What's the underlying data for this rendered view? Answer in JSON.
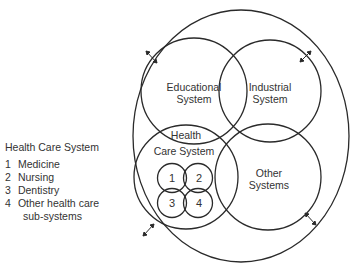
{
  "diagram": {
    "outer_circle": {
      "label": ""
    },
    "systems": [
      {
        "id": "educational",
        "line1": "Educational",
        "line2": "System"
      },
      {
        "id": "industrial",
        "line1": "Industrial",
        "line2": "System"
      },
      {
        "id": "health",
        "line1": "Health",
        "line2": "Care System"
      },
      {
        "id": "other",
        "line1": "Other",
        "line2": "Systems"
      }
    ],
    "subsystems": [
      "1",
      "2",
      "3",
      "4"
    ]
  },
  "legend": {
    "title": "Health Care System",
    "items": [
      {
        "num": "1",
        "label": "Medicine"
      },
      {
        "num": "2",
        "label": "Nursing"
      },
      {
        "num": "3",
        "label": "Dentistry"
      },
      {
        "num": "4",
        "label": "Other health care"
      }
    ],
    "continuation": "sub-systems"
  },
  "colors": {
    "stroke": "#2a2a2a",
    "background": "#ffffff"
  }
}
